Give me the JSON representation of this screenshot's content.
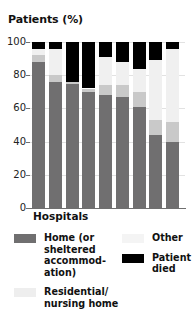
{
  "chart_data": {
    "type": "bar",
    "title": "Patients (%)",
    "xlabel": "Hospitals",
    "ylabel": "Patients (%)",
    "ylim": [
      0,
      100
    ],
    "yticks": [
      0,
      20,
      40,
      60,
      80,
      100
    ],
    "ytick_labels": [
      "0",
      "20",
      "40",
      "60",
      "80",
      "100"
    ],
    "grid": true,
    "stacked": true,
    "legend_position": "below",
    "categories": [
      "1",
      "2",
      "3",
      "4",
      "5",
      "6",
      "7",
      "8",
      "9"
    ],
    "series": [
      {
        "name": "Home (or sheltered accommodation)",
        "color": "#706f70",
        "values": [
          88,
          76,
          75,
          70,
          68,
          67,
          61,
          44,
          40
        ]
      },
      {
        "name": "Residential/nursing home",
        "color": "#c9c9c9",
        "values": [
          4,
          4,
          1,
          2,
          6,
          7,
          9,
          9,
          12
        ]
      },
      {
        "name": "Other",
        "color": "#f0f0f0",
        "values": [
          4,
          16,
          0,
          0,
          17,
          14,
          14,
          36,
          44
        ]
      },
      {
        "name": "Patient died",
        "color": "#000000",
        "values": [
          4,
          4,
          24,
          28,
          9,
          12,
          16,
          11,
          4
        ]
      }
    ]
  },
  "legend": {
    "items": [
      {
        "label": "Home (or sheltered accommod-ation)",
        "swatch": "home"
      },
      {
        "label": "Residential/ nursing home",
        "swatch": "residential"
      },
      {
        "label": "Other",
        "swatch": "other"
      },
      {
        "label": "Patient died",
        "swatch": "died"
      }
    ],
    "home_label": "Home (or sheltered accommod- ation)",
    "residential_label": "Residential/ nursing home",
    "other_label": "Other",
    "died_label": "Patient died"
  }
}
